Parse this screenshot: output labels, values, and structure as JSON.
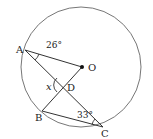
{
  "diagram": {
    "type": "circle-geometry",
    "circle": {
      "cx": 81,
      "cy": 67,
      "r": 60
    },
    "points": {
      "A": {
        "label": "A",
        "x": 25,
        "y": 50
      },
      "O": {
        "label": "O",
        "x": 82,
        "y": 67
      },
      "D": {
        "label": "D",
        "x": 63,
        "y": 85
      },
      "B": {
        "label": "B",
        "x": 42,
        "y": 111
      },
      "C": {
        "label": "C",
        "x": 103,
        "y": 127
      }
    },
    "segments": [
      "A-O",
      "A-C",
      "B-O",
      "B-C"
    ],
    "angles": {
      "OAC": {
        "label": "26°"
      },
      "BCA": {
        "label": "33°"
      },
      "ADB": {
        "label": "x"
      }
    },
    "colors": {
      "stroke": "#333333",
      "circle": "#555555",
      "text": "#222222"
    }
  }
}
